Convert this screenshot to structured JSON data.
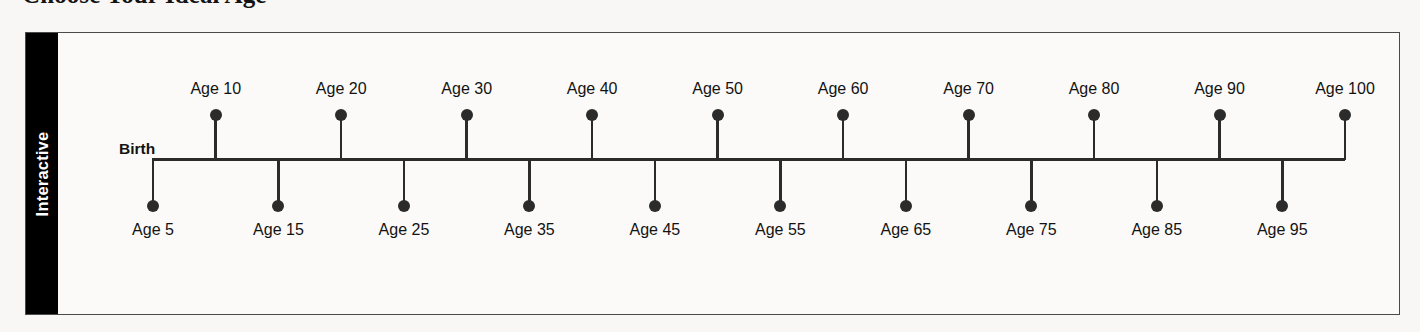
{
  "page": {
    "title": "Choose Your Ideal Age",
    "background_color": "#f8f7f5"
  },
  "panel": {
    "side_tab_label": "Interactive",
    "side_tab_background": "#000000",
    "side_tab_text_color": "#ffffff",
    "border_color": "#4a4a4a"
  },
  "chart_data": {
    "type": "timeline",
    "title": "Choose Your Ideal Age",
    "origin_label": "Birth",
    "axis_color": "#2b2b2b",
    "marker_color": "#2b2b2b",
    "xlabel": "",
    "ylabel": "",
    "xlim": [
      0,
      100
    ],
    "grid": false,
    "legend": "none",
    "tick_step": 5,
    "ticks": [
      {
        "age": 5,
        "label": "Age 5",
        "side": "below"
      },
      {
        "age": 10,
        "label": "Age 10",
        "side": "above"
      },
      {
        "age": 15,
        "label": "Age 15",
        "side": "below"
      },
      {
        "age": 20,
        "label": "Age 20",
        "side": "above"
      },
      {
        "age": 25,
        "label": "Age 25",
        "side": "below"
      },
      {
        "age": 30,
        "label": "Age 30",
        "side": "above"
      },
      {
        "age": 35,
        "label": "Age 35",
        "side": "below"
      },
      {
        "age": 40,
        "label": "Age 40",
        "side": "above"
      },
      {
        "age": 45,
        "label": "Age 45",
        "side": "below"
      },
      {
        "age": 50,
        "label": "Age 50",
        "side": "above"
      },
      {
        "age": 55,
        "label": "Age 55",
        "side": "below"
      },
      {
        "age": 60,
        "label": "Age 60",
        "side": "above"
      },
      {
        "age": 65,
        "label": "Age 65",
        "side": "below"
      },
      {
        "age": 70,
        "label": "Age 70",
        "side": "above"
      },
      {
        "age": 75,
        "label": "Age 75",
        "side": "below"
      },
      {
        "age": 80,
        "label": "Age 80",
        "side": "above"
      },
      {
        "age": 85,
        "label": "Age 85",
        "side": "below"
      },
      {
        "age": 90,
        "label": "Age 90",
        "side": "above"
      },
      {
        "age": 95,
        "label": "Age 95",
        "side": "below"
      },
      {
        "age": 100,
        "label": "Age 100",
        "side": "above"
      }
    ]
  },
  "layout": {
    "axis_left_px": 94,
    "axis_right_px": 1286
  }
}
